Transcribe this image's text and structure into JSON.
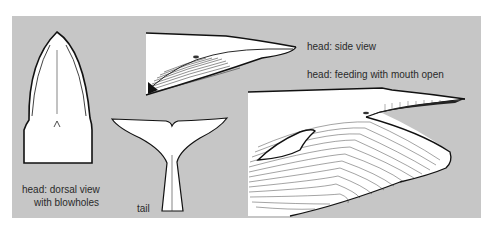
{
  "figure": {
    "background_color": "#c6c6c6",
    "ink_color": "#111111",
    "fill_color": "#ffffff",
    "labels": {
      "dorsal_line1": "head: dorsal view",
      "dorsal_line2": "with blowholes",
      "tail": "tail",
      "side": "head: side view",
      "feeding": "head: feeding with mouth open"
    },
    "panels": [
      {
        "id": "dorsal-head",
        "caption": "head: dorsal view with blowholes"
      },
      {
        "id": "side-head",
        "caption": "head: side view"
      },
      {
        "id": "tail",
        "caption": "tail"
      },
      {
        "id": "feeding-head",
        "caption": "head: feeding with mouth open"
      }
    ]
  }
}
